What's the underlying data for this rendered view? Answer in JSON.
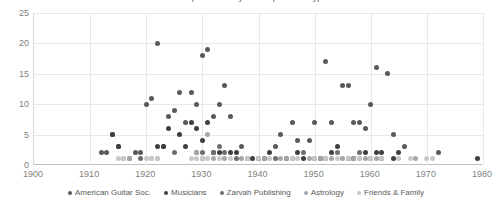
{
  "chart_data": {
    "type": "scatter",
    "title": "Correspondence by Correspondent Type",
    "xlabel": "",
    "ylabel": "",
    "xlim": [
      1900,
      1980
    ],
    "ylim": [
      0,
      25
    ],
    "xticks": [
      1900,
      1910,
      1920,
      1930,
      1940,
      1950,
      1960,
      1970,
      1980
    ],
    "yticks": [
      0,
      5,
      10,
      15,
      20,
      25
    ],
    "grid": true,
    "legend_position": "bottom",
    "series": [
      {
        "name": "American Guitar Soc.",
        "color": "#595959",
        "points": [
          [
            1912,
            2
          ],
          [
            1913,
            2
          ],
          [
            1914,
            5
          ],
          [
            1915,
            3
          ],
          [
            1918,
            2
          ],
          [
            1919,
            2
          ],
          [
            1920,
            10
          ],
          [
            1921,
            11
          ],
          [
            1922,
            20
          ],
          [
            1923,
            3
          ],
          [
            1924,
            8
          ],
          [
            1925,
            9
          ],
          [
            1926,
            12
          ],
          [
            1927,
            7
          ],
          [
            1928,
            12
          ],
          [
            1929,
            10
          ],
          [
            1930,
            18
          ],
          [
            1931,
            19
          ],
          [
            1932,
            8
          ],
          [
            1933,
            10
          ],
          [
            1934,
            13
          ],
          [
            1935,
            8
          ],
          [
            1937,
            3
          ],
          [
            1943,
            3
          ],
          [
            1944,
            5
          ],
          [
            1946,
            7
          ],
          [
            1947,
            4
          ],
          [
            1949,
            4
          ],
          [
            1950,
            7
          ],
          [
            1952,
            17
          ],
          [
            1953,
            7
          ],
          [
            1955,
            13
          ],
          [
            1956,
            13
          ],
          [
            1957,
            7
          ],
          [
            1958,
            7
          ],
          [
            1959,
            6
          ],
          [
            1960,
            10
          ],
          [
            1961,
            16
          ],
          [
            1963,
            15
          ],
          [
            1964,
            5
          ],
          [
            1966,
            3
          ],
          [
            1972,
            2
          ]
        ]
      },
      {
        "name": "Musicians",
        "color": "#3f3f3f",
        "points": [
          [
            1914,
            5
          ],
          [
            1915,
            3
          ],
          [
            1922,
            3
          ],
          [
            1923,
            3
          ],
          [
            1924,
            6
          ],
          [
            1926,
            5
          ],
          [
            1927,
            3
          ],
          [
            1928,
            7
          ],
          [
            1929,
            6
          ],
          [
            1930,
            4
          ],
          [
            1931,
            7
          ],
          [
            1932,
            2
          ],
          [
            1933,
            2
          ],
          [
            1935,
            2
          ],
          [
            1936,
            2
          ],
          [
            1939,
            1
          ],
          [
            1940,
            1
          ],
          [
            1941,
            1
          ],
          [
            1942,
            2
          ],
          [
            1945,
            1
          ],
          [
            1947,
            2
          ],
          [
            1948,
            1
          ],
          [
            1951,
            1
          ],
          [
            1953,
            2
          ],
          [
            1954,
            3
          ],
          [
            1957,
            1
          ],
          [
            1959,
            2
          ],
          [
            1961,
            2
          ],
          [
            1962,
            2
          ],
          [
            1964,
            1
          ],
          [
            1965,
            2
          ],
          [
            1979,
            1
          ]
        ]
      },
      {
        "name": "Zarvah Publishing",
        "color": "#6e6e6e",
        "points": [
          [
            1917,
            1
          ],
          [
            1919,
            1
          ],
          [
            1925,
            2
          ],
          [
            1929,
            2
          ],
          [
            1930,
            2
          ],
          [
            1932,
            2
          ],
          [
            1933,
            3
          ],
          [
            1934,
            2
          ],
          [
            1936,
            1
          ],
          [
            1938,
            1
          ],
          [
            1943,
            1
          ],
          [
            1946,
            1
          ],
          [
            1948,
            2
          ],
          [
            1950,
            1
          ],
          [
            1952,
            1
          ],
          [
            1954,
            2
          ],
          [
            1956,
            1
          ],
          [
            1958,
            2
          ],
          [
            1960,
            1
          ],
          [
            1962,
            1
          ]
        ]
      },
      {
        "name": "Astrology",
        "color": "#a6a6a6",
        "points": [
          [
            1916,
            1
          ],
          [
            1917,
            1
          ],
          [
            1921,
            1
          ],
          [
            1922,
            1
          ],
          [
            1929,
            2
          ],
          [
            1930,
            1
          ],
          [
            1931,
            5
          ],
          [
            1932,
            1
          ],
          [
            1934,
            1
          ],
          [
            1937,
            1
          ],
          [
            1941,
            1
          ],
          [
            1944,
            1
          ],
          [
            1945,
            1
          ],
          [
            1949,
            1
          ],
          [
            1951,
            1
          ],
          [
            1953,
            1
          ],
          [
            1955,
            1
          ],
          [
            1957,
            1
          ],
          [
            1958,
            1
          ],
          [
            1959,
            1
          ],
          [
            1961,
            1
          ],
          [
            1968,
            1
          ]
        ]
      },
      {
        "name": "Friends & Family",
        "color": "#c8c8c8",
        "points": [
          [
            1915,
            1
          ],
          [
            1916,
            1
          ],
          [
            1920,
            1
          ],
          [
            1921,
            1
          ],
          [
            1922,
            1
          ],
          [
            1928,
            1
          ],
          [
            1929,
            1
          ],
          [
            1930,
            1
          ],
          [
            1931,
            1
          ],
          [
            1933,
            1
          ],
          [
            1935,
            1
          ],
          [
            1938,
            1
          ],
          [
            1940,
            1
          ],
          [
            1942,
            1
          ],
          [
            1946,
            1
          ],
          [
            1947,
            1
          ],
          [
            1950,
            1
          ],
          [
            1952,
            1
          ],
          [
            1954,
            1
          ],
          [
            1956,
            1
          ],
          [
            1958,
            1
          ],
          [
            1960,
            1
          ],
          [
            1962,
            1
          ],
          [
            1965,
            1
          ],
          [
            1967,
            1
          ],
          [
            1970,
            1
          ],
          [
            1971,
            1
          ]
        ]
      }
    ]
  }
}
